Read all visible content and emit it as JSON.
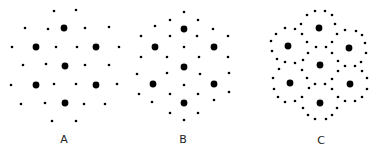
{
  "figure": {
    "background": "#ffffff",
    "dot_color": "#000000",
    "large_radius": 3.4,
    "small_radius": 1.3,
    "panels": [
      {
        "id": "A",
        "label": "A",
        "label_pos": [
          64,
          139
        ],
        "large": [
          [
            64,
            28
          ],
          [
            36,
            47
          ],
          [
            96,
            47
          ],
          [
            65,
            66
          ],
          [
            36,
            85
          ],
          [
            96,
            85
          ],
          [
            65,
            103
          ]
        ],
        "small": [
          [
            54,
            11
          ],
          [
            76,
            10
          ],
          [
            25,
            28
          ],
          [
            48,
            29
          ],
          [
            85,
            28
          ],
          [
            109,
            27
          ],
          [
            12,
            47
          ],
          [
            56,
            47
          ],
          [
            77,
            47
          ],
          [
            119,
            47
          ],
          [
            23,
            65
          ],
          [
            46,
            64
          ],
          [
            85,
            65
          ],
          [
            109,
            65
          ],
          [
            11,
            85
          ],
          [
            54,
            84
          ],
          [
            76,
            84
          ],
          [
            117,
            84
          ],
          [
            21,
            104
          ],
          [
            45,
            103
          ],
          [
            84,
            104
          ],
          [
            105,
            104
          ],
          [
            52,
            121
          ],
          [
            76,
            121
          ]
        ]
      },
      {
        "id": "B",
        "label": "B",
        "label_pos": [
          183,
          139
        ],
        "large": [
          [
            184,
            29
          ],
          [
            155,
            47
          ],
          [
            214,
            47
          ],
          [
            184,
            67
          ],
          [
            153,
            84
          ],
          [
            214,
            84
          ],
          [
            184,
            103
          ]
        ],
        "small": [
          [
            184,
            12
          ],
          [
            170,
            20
          ],
          [
            198,
            20
          ],
          [
            155,
            26
          ],
          [
            213,
            29
          ],
          [
            141,
            36
          ],
          [
            170,
            36
          ],
          [
            197,
            36
          ],
          [
            228,
            36
          ],
          [
            184,
            47
          ],
          [
            141,
            57
          ],
          [
            167,
            57
          ],
          [
            199,
            57
          ],
          [
            228,
            57
          ],
          [
            137,
            74
          ],
          [
            167,
            73
          ],
          [
            200,
            74
          ],
          [
            229,
            73
          ],
          [
            184,
            85
          ],
          [
            139,
            94
          ],
          [
            170,
            94
          ],
          [
            198,
            94
          ],
          [
            229,
            92
          ],
          [
            152,
            102
          ],
          [
            214,
            100
          ],
          [
            170,
            113
          ],
          [
            198,
            113
          ],
          [
            184,
            120
          ]
        ]
      },
      {
        "id": "C",
        "label": "C",
        "label_pos": [
          321,
          140
        ],
        "large": [
          [
            319,
            28
          ],
          [
            288,
            46
          ],
          [
            349,
            48
          ],
          [
            320,
            65
          ],
          [
            290,
            83
          ],
          [
            350,
            84
          ],
          [
            320,
            103
          ]
        ],
        "small": [
          [
            315,
            11
          ],
          [
            325,
            11
          ],
          [
            307,
            15
          ],
          [
            332,
            15
          ],
          [
            301,
            24
          ],
          [
            335,
            24
          ],
          [
            285,
            28
          ],
          [
            295,
            29
          ],
          [
            276,
            34
          ],
          [
            302,
            34
          ],
          [
            337,
            34
          ],
          [
            345,
            30
          ],
          [
            356,
            31
          ],
          [
            362,
            35
          ],
          [
            271,
            41
          ],
          [
            307,
            42
          ],
          [
            332,
            42
          ],
          [
            365,
            43
          ],
          [
            272,
            51
          ],
          [
            316,
            47
          ],
          [
            326,
            47
          ],
          [
            308,
            53
          ],
          [
            332,
            53
          ],
          [
            366,
            53
          ],
          [
            277,
            59
          ],
          [
            303,
            60
          ],
          [
            338,
            61
          ],
          [
            361,
            62
          ],
          [
            285,
            62
          ],
          [
            295,
            63
          ],
          [
            279,
            69
          ],
          [
            302,
            70
          ],
          [
            345,
            66
          ],
          [
            355,
            66
          ],
          [
            338,
            71
          ],
          [
            362,
            71
          ],
          [
            273,
            78
          ],
          [
            307,
            78
          ],
          [
            332,
            79
          ],
          [
            367,
            78
          ],
          [
            315,
            84
          ],
          [
            325,
            84
          ],
          [
            274,
            89
          ],
          [
            309,
            88
          ],
          [
            332,
            89
          ],
          [
            367,
            89
          ],
          [
            278,
            97
          ],
          [
            302,
            97
          ],
          [
            338,
            97
          ],
          [
            362,
            97
          ],
          [
            285,
            102
          ],
          [
            295,
            101
          ],
          [
            345,
            101
          ],
          [
            355,
            101
          ],
          [
            303,
            108
          ],
          [
            337,
            108
          ],
          [
            308,
            115
          ],
          [
            332,
            115
          ],
          [
            315,
            119
          ],
          [
            326,
            119
          ]
        ]
      }
    ]
  }
}
